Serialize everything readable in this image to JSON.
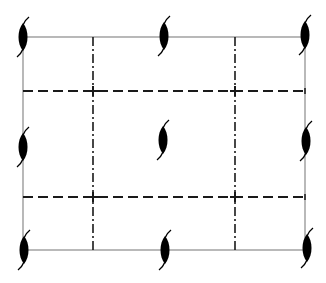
{
  "figure": {
    "caption": "",
    "colors": {
      "background": "#ffffff",
      "cell_edge": "#8a8a8a",
      "symbol": "#000000",
      "dashed": "#1a1a1a",
      "dash_dot": "#1a1a1a"
    },
    "cell": {
      "x1": 23,
      "y1": 37,
      "x2": 305,
      "y2": 250
    },
    "vertical_dash_dot_lines": [
      {
        "x": 93,
        "y1": 37,
        "y2": 250
      },
      {
        "x": 235,
        "y1": 37,
        "y2": 250
      }
    ],
    "horizontal_dashed_lines": [
      {
        "y": 91,
        "x1": 23,
        "x2": 305
      },
      {
        "y": 197,
        "x1": 23,
        "x2": 305
      }
    ],
    "twofold_axis_symbols": [
      {
        "id": "top-left",
        "x": 23,
        "y": 37
      },
      {
        "id": "top-middle",
        "x": 164,
        "y": 36
      },
      {
        "id": "top-right",
        "x": 305,
        "y": 35
      },
      {
        "id": "middle-left",
        "x": 23,
        "y": 147
      },
      {
        "id": "center",
        "x": 163,
        "y": 140
      },
      {
        "id": "middle-right",
        "x": 306,
        "y": 141
      },
      {
        "id": "bottom-left",
        "x": 24,
        "y": 250
      },
      {
        "id": "bottom-middle",
        "x": 165,
        "y": 250
      },
      {
        "id": "bottom-right",
        "x": 307,
        "y": 248
      }
    ]
  }
}
